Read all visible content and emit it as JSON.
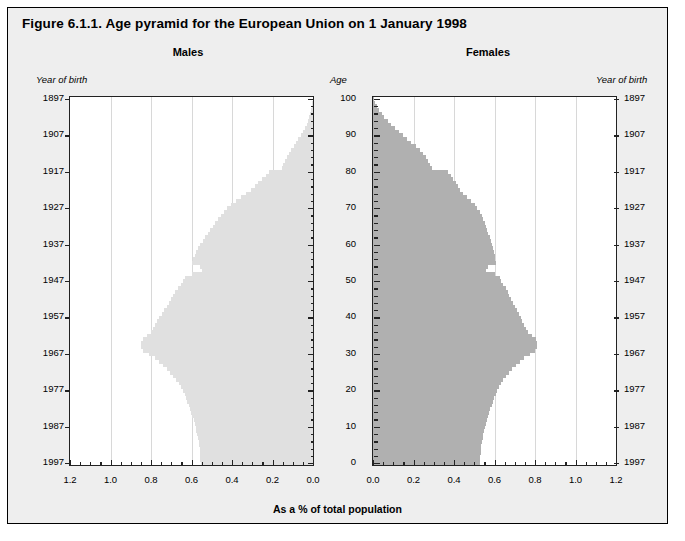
{
  "figure": {
    "title": "Figure 6.1.1. Age pyramid for the European Union on 1 January 1998",
    "males_header": "Males",
    "females_header": "Females",
    "year_of_birth_label_left": "Year of birth",
    "year_of_birth_label_right": "Year of birth",
    "age_label": "Age",
    "xaxis_title": "As a % of total population",
    "colors": {
      "males_fill": "#e0e0e0",
      "females_fill": "#b0b0b0",
      "background": "#eeeeee",
      "plot_background": "#ffffff",
      "axis": "#222222",
      "gridline": "#d8d8d8"
    }
  },
  "chart_data": {
    "type": "bar",
    "title": "Figure 6.1.1. Age pyramid for the European Union on 1 January 1998",
    "subtitle": "",
    "orientation": "horizontal-population-pyramid",
    "xlabel": "As a % of total population",
    "ylabel": "Age",
    "ylabel_secondary": "Year of birth",
    "grid": true,
    "legend_position": "none",
    "xlim_males": [
      1.2,
      0.0
    ],
    "xlim_females": [
      0.0,
      1.2
    ],
    "ylim": [
      0,
      100
    ],
    "xticks": [
      0.0,
      0.2,
      0.4,
      0.6,
      0.8,
      1.0,
      1.2
    ],
    "xticklabels_males": [
      "1.2",
      "1.0",
      "0.8",
      "0.6",
      "0.4",
      "0.2",
      "0.0"
    ],
    "xticklabels_females": [
      "0.0",
      "0.2",
      "0.4",
      "0.6",
      "0.8",
      "1.0",
      "1.2"
    ],
    "yticks": [
      0,
      10,
      20,
      30,
      40,
      50,
      60,
      70,
      80,
      90,
      100
    ],
    "yticklabels": [
      "0",
      "10",
      "20",
      "30",
      "40",
      "50",
      "60",
      "70",
      "80",
      "90",
      "100"
    ],
    "year_of_birth_ticks": [
      1997,
      1987,
      1977,
      1967,
      1957,
      1947,
      1937,
      1927,
      1917,
      1907,
      1897
    ],
    "ages": [
      0,
      1,
      2,
      3,
      4,
      5,
      6,
      7,
      8,
      9,
      10,
      11,
      12,
      13,
      14,
      15,
      16,
      17,
      18,
      19,
      20,
      21,
      22,
      23,
      24,
      25,
      26,
      27,
      28,
      29,
      30,
      31,
      32,
      33,
      34,
      35,
      36,
      37,
      38,
      39,
      40,
      41,
      42,
      43,
      44,
      45,
      46,
      47,
      48,
      49,
      50,
      51,
      52,
      53,
      54,
      55,
      56,
      57,
      58,
      59,
      60,
      61,
      62,
      63,
      64,
      65,
      66,
      67,
      68,
      69,
      70,
      71,
      72,
      73,
      74,
      75,
      76,
      77,
      78,
      79,
      80,
      81,
      82,
      83,
      84,
      85,
      86,
      87,
      88,
      89,
      90,
      91,
      92,
      93,
      94,
      95,
      96,
      97,
      98,
      99,
      100
    ],
    "series": [
      {
        "name": "Males",
        "color": "#e0e0e0",
        "values": [
          0.555,
          0.556,
          0.557,
          0.558,
          0.56,
          0.562,
          0.565,
          0.568,
          0.572,
          0.576,
          0.58,
          0.585,
          0.59,
          0.596,
          0.602,
          0.608,
          0.614,
          0.62,
          0.627,
          0.634,
          0.642,
          0.652,
          0.663,
          0.676,
          0.69,
          0.706,
          0.722,
          0.74,
          0.76,
          0.782,
          0.812,
          0.84,
          0.848,
          0.85,
          0.842,
          0.82,
          0.8,
          0.788,
          0.778,
          0.77,
          0.76,
          0.748,
          0.735,
          0.722,
          0.71,
          0.7,
          0.69,
          0.68,
          0.668,
          0.652,
          0.64,
          0.634,
          0.6,
          0.548,
          0.56,
          0.6,
          0.592,
          0.584,
          0.576,
          0.568,
          0.556,
          0.544,
          0.532,
          0.52,
          0.508,
          0.496,
          0.484,
          0.47,
          0.456,
          0.44,
          0.424,
          0.404,
          0.382,
          0.356,
          0.33,
          0.308,
          0.288,
          0.27,
          0.252,
          0.234,
          0.216,
          0.154,
          0.146,
          0.138,
          0.13,
          0.12,
          0.108,
          0.096,
          0.084,
          0.072,
          0.06,
          0.049,
          0.04,
          0.032,
          0.025,
          0.019,
          0.014,
          0.01,
          0.007,
          0.004,
          0.002
        ]
      },
      {
        "name": "Females",
        "color": "#b0b0b0",
        "values": [
          0.528,
          0.529,
          0.53,
          0.531,
          0.533,
          0.535,
          0.538,
          0.541,
          0.545,
          0.549,
          0.553,
          0.558,
          0.563,
          0.568,
          0.574,
          0.58,
          0.586,
          0.592,
          0.598,
          0.605,
          0.613,
          0.622,
          0.632,
          0.644,
          0.657,
          0.672,
          0.688,
          0.705,
          0.724,
          0.745,
          0.775,
          0.802,
          0.81,
          0.812,
          0.804,
          0.784,
          0.766,
          0.754,
          0.745,
          0.738,
          0.73,
          0.72,
          0.71,
          0.7,
          0.69,
          0.682,
          0.674,
          0.666,
          0.656,
          0.642,
          0.632,
          0.628,
          0.6,
          0.556,
          0.568,
          0.608,
          0.604,
          0.6,
          0.596,
          0.592,
          0.588,
          0.582,
          0.576,
          0.57,
          0.564,
          0.558,
          0.552,
          0.544,
          0.536,
          0.526,
          0.516,
          0.502,
          0.486,
          0.466,
          0.446,
          0.432,
          0.42,
          0.408,
          0.396,
          0.384,
          0.372,
          0.29,
          0.282,
          0.272,
          0.262,
          0.248,
          0.23,
          0.21,
          0.19,
          0.17,
          0.15,
          0.128,
          0.108,
          0.09,
          0.072,
          0.056,
          0.042,
          0.03,
          0.02,
          0.012,
          0.006
        ]
      }
    ]
  }
}
